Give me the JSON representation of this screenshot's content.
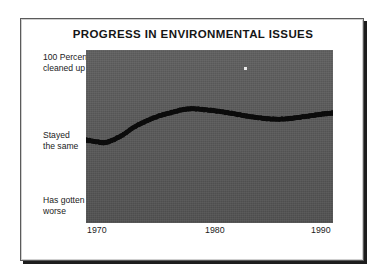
{
  "chart_data": {
    "type": "line",
    "title": "PROGRESS IN ENVIRONMENTAL ISSUES",
    "xlabel": "",
    "ylabel": "",
    "grid": false,
    "legend": "none",
    "style": "dotted-thick-black-line-on-gray-panel",
    "xlim": [
      1970,
      1990
    ],
    "ylim": [
      0,
      100
    ],
    "xticks": [
      "1970",
      "1980",
      "1990"
    ],
    "xtick_values": [
      1970,
      1980,
      1990
    ],
    "ytick_labels": [
      "100 Percent cleaned up",
      "Stayed the same",
      "Has gotten worse"
    ],
    "ytick_values": [
      100,
      50,
      0
    ],
    "y_axis_note": "Categorical scale: top = 100 Percent cleaned up, middle = Stayed the same, bottom = Has gotten worse",
    "series": [
      {
        "name": "Perceived progress",
        "x": [
          1970,
          1970.8,
          1971.5,
          1972.2,
          1973,
          1973.8,
          1974.6,
          1975.4,
          1976.2,
          1977,
          1977.8,
          1978.5,
          1979.2,
          1980,
          1980.8,
          1981.6,
          1982.4,
          1983.2,
          1984,
          1984.8,
          1985.6,
          1986.4,
          1987.2,
          1988,
          1988.8,
          1989.4,
          1990
        ],
        "values": [
          48,
          47,
          46.5,
          48,
          51,
          55,
          58,
          60.5,
          62.5,
          64,
          65.5,
          66,
          65.8,
          65.2,
          64.5,
          63.6,
          62.6,
          61.6,
          60.8,
          60.2,
          60,
          60.3,
          61,
          61.8,
          62.6,
          63.2,
          63.6
        ]
      }
    ]
  },
  "ylabels": {
    "top_line1": "100 Percent",
    "top_line2": "cleaned up",
    "mid_line1": "Stayed",
    "mid_line2": "the same",
    "bot_line1": "Has gotten",
    "bot_line2": "worse"
  },
  "colors": {
    "panel": "#575757",
    "line": "#0d0d0d",
    "text": "#1b1b1b",
    "page": "#ffffff",
    "frame": "#5b5b5b"
  }
}
